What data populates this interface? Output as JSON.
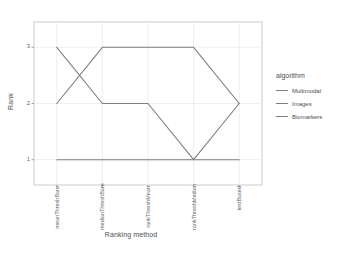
{
  "chart_data": {
    "type": "line",
    "title": "",
    "xlabel": "Ranking method",
    "ylabel": "Rank",
    "categories": [
      "meanThreshBare",
      "medianThreshBare",
      "rankThreshMean",
      "rankThreshMedian",
      "testBased"
    ],
    "ytick_labels": [
      "1",
      "2",
      "3"
    ],
    "ytick_values": [
      1,
      2,
      3
    ],
    "ylim": [
      0.55,
      3.45
    ],
    "grid": true,
    "legend_position": "right",
    "legend_title": "algorithm",
    "series": [
      {
        "name": "Multimodal",
        "color": "#7f7f7f",
        "values": [
          3,
          2,
          2,
          1,
          2
        ]
      },
      {
        "name": "Images",
        "color": "#7f7f7f",
        "values": [
          2,
          3,
          3,
          3,
          2
        ]
      },
      {
        "name": "Biomarkers",
        "color": "#7f7f7f",
        "values": [
          1,
          1,
          1,
          1,
          1
        ]
      }
    ]
  },
  "colors": {
    "panel_background": "#ffffff",
    "panel_border": "#bfbfbf",
    "grid_line": "#e6e6e6",
    "text": "#4d4d4d",
    "tick_text": "#666666"
  }
}
